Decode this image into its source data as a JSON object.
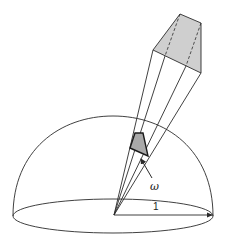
{
  "diagram": {
    "title": "",
    "labels": {
      "solid_angle": "ω",
      "radius": "1"
    },
    "colors": {
      "line": "#2b2b2b",
      "far_patch_fill": "#cfcfcf",
      "near_patch_fill": "#a9a9a9",
      "background": "#ffffff"
    },
    "geometry": {
      "origin": [
        114,
        215
      ],
      "hemisphere": {
        "cx": 113,
        "cy": 216,
        "rx": 100,
        "ry": 17,
        "top_y": 116
      },
      "far_patch": [
        [
          180,
          14
        ],
        [
          201,
          23
        ],
        [
          201,
          73
        ],
        [
          153,
          50
        ]
      ],
      "near_patch": [
        [
          135,
          133
        ],
        [
          143,
          133
        ],
        [
          148,
          156
        ],
        [
          130,
          148
        ]
      ],
      "radius_arrow_end": [
        213,
        215
      ]
    }
  }
}
